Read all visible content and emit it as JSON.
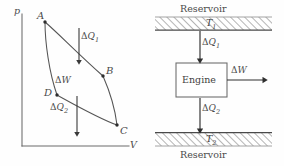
{
  "figure": {
    "background": "#fefefe",
    "ink": "#4a4a4a"
  },
  "pv_diagram": {
    "name": "pressure-volume-cycle",
    "axes": {
      "y_label": "p",
      "x_label": "V"
    },
    "points": [
      {
        "label": "A",
        "x": 45,
        "y": 22
      },
      {
        "label": "B",
        "x": 103,
        "y": 76
      },
      {
        "label": "C",
        "x": 117,
        "y": 125
      },
      {
        "label": "D",
        "x": 57,
        "y": 95
      }
    ],
    "annotations": [
      {
        "id": "dq1",
        "symbol": "ΔQ",
        "subscript": "1",
        "text": "ΔQ1",
        "direction": "down"
      },
      {
        "id": "dw",
        "symbol": "ΔW",
        "subscript": "",
        "text": "ΔW",
        "direction": "none"
      },
      {
        "id": "dq2",
        "symbol": "ΔQ",
        "subscript": "2",
        "text": "ΔQ2",
        "direction": "down"
      }
    ]
  },
  "engine_schematic": {
    "name": "engine-energy-flow",
    "hot_reservoir": {
      "label": "Reservoir",
      "temperature_symbol": "T",
      "temperature_subscript": "1",
      "temperature_text": "T1"
    },
    "cold_reservoir": {
      "label": "Reservoir",
      "temperature_symbol": "T",
      "temperature_subscript": "2",
      "temperature_text": "T2"
    },
    "engine_box": {
      "label": "Engine"
    },
    "flows": [
      {
        "id": "heat-in",
        "symbol": "ΔQ",
        "subscript": "1",
        "text": "ΔQ1",
        "direction": "down"
      },
      {
        "id": "work-out",
        "symbol": "ΔW",
        "subscript": "",
        "text": "ΔW",
        "direction": "right"
      },
      {
        "id": "heat-out",
        "symbol": "ΔQ",
        "subscript": "2",
        "text": "ΔQ2",
        "direction": "down"
      }
    ]
  }
}
